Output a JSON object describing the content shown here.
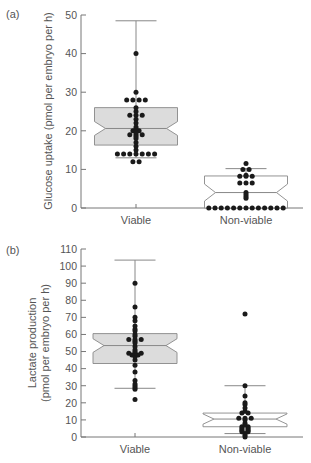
{
  "chart_data": [
    {
      "type": "box",
      "panel_label": "(a)",
      "title": "",
      "xlabel": "",
      "ylabel": "Glucose uptake (pmol per embryo per h)",
      "ylabel_lines": [
        "Glucose uptake (pmol per embryo per h)"
      ],
      "ylim": [
        0,
        50
      ],
      "yticks": [
        0,
        10,
        20,
        30,
        40,
        50
      ],
      "categories": [
        "Viable",
        "Non-viable"
      ],
      "notched": true,
      "series": [
        {
          "name": "Viable",
          "fill": "#dcdcdc",
          "whisker_low": 13,
          "q1": 16.3,
          "median": 20.6,
          "q3": 26,
          "whisker_high": 48.5,
          "notch_low": 18.8,
          "notch_high": 22.4,
          "points": [
            40,
            30,
            28,
            28,
            28,
            28,
            26,
            25,
            24,
            24,
            24,
            23,
            22,
            21,
            20.5,
            20,
            20,
            19.5,
            19,
            19,
            19,
            18.5,
            18,
            17,
            16,
            15,
            14,
            14,
            14,
            14,
            14,
            14,
            14,
            12,
            12
          ]
        },
        {
          "name": "Non-viable",
          "fill": "#ffffff",
          "whisker_low": 0,
          "q1": 0,
          "median": 4,
          "q3": 8.3,
          "whisker_high": 10.2,
          "notch_low": 1.8,
          "notch_high": 6.2,
          "points": [
            11.5,
            10,
            10,
            8.5,
            8.2,
            8.2,
            8.2,
            6.5,
            6.5,
            6.5,
            4,
            3.5,
            3,
            2.5,
            0,
            0,
            0,
            0,
            0,
            0,
            0,
            0,
            0,
            0,
            0,
            0,
            0
          ]
        }
      ]
    },
    {
      "type": "box",
      "panel_label": "(b)",
      "title": "",
      "xlabel": "",
      "ylabel": "Lactate production (pmol per embryo per h)",
      "ylabel_lines": [
        "Lactate production",
        "(pmol per embryo per h)"
      ],
      "ylim": [
        0,
        110
      ],
      "yticks": [
        0,
        10,
        20,
        30,
        40,
        50,
        60,
        70,
        80,
        90,
        100,
        110
      ],
      "categories": [
        "Viable",
        "Non-viable"
      ],
      "notched": true,
      "series": [
        {
          "name": "Viable",
          "fill": "#dcdcdc",
          "whisker_low": 28.5,
          "q1": 43,
          "median": 53.5,
          "q3": 60.5,
          "whisker_high": 103.5,
          "notch_low": 49.5,
          "notch_high": 57.5,
          "points": [
            90,
            76,
            70,
            68,
            65,
            63,
            62,
            60,
            59,
            57,
            57,
            57,
            56,
            55,
            53,
            51,
            50,
            49,
            49,
            49,
            48,
            48,
            47,
            45,
            42,
            38,
            33,
            31,
            30,
            29,
            28,
            22
          ]
        },
        {
          "name": "Non-viable",
          "fill": "#ffffff",
          "whisker_low": 2,
          "q1": 6,
          "median": 10.5,
          "q3": 14,
          "whisker_high": 30,
          "notch_low": 7.5,
          "notch_high": 13.5,
          "points": [
            72,
            30,
            24,
            20,
            19,
            17,
            15,
            14,
            14,
            11,
            11,
            11,
            10,
            8,
            7,
            6,
            6,
            5,
            5,
            4,
            4,
            3,
            3,
            2,
            1,
            0
          ]
        }
      ]
    }
  ]
}
